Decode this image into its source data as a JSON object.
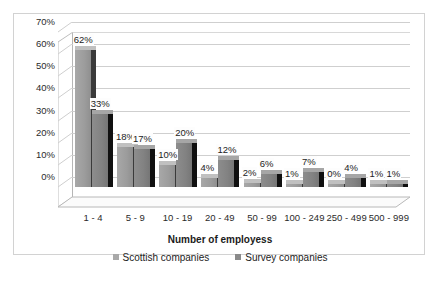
{
  "chart_data": {
    "type": "bar",
    "title": "",
    "subtitle": "",
    "xlabel": "Number of employess",
    "ylabel": "",
    "categories": [
      "1 - 4",
      "5 - 9",
      "10 - 19",
      "20 - 49",
      "50 - 99",
      "100 - 249",
      "250 - 499",
      "500 - 999"
    ],
    "series": [
      {
        "name": "Scottish companies",
        "color": "#a9a9a9",
        "values": [
          62,
          18,
          10,
          4,
          2,
          1,
          0,
          1
        ],
        "labels": [
          "62%",
          "18%",
          "10%",
          "4%",
          "2%",
          "1%",
          "0%",
          "1%"
        ]
      },
      {
        "name": "Survey companies",
        "color": "#8a8a8a",
        "values": [
          33,
          17,
          20,
          12,
          6,
          7,
          4,
          1
        ],
        "labels": [
          "33%",
          "17%",
          "20%",
          "12%",
          "6%",
          "7%",
          "4%",
          "1%"
        ]
      }
    ],
    "ylim": [
      0,
      70
    ],
    "ytick_labels": [
      "70%",
      "60%",
      "50%",
      "40%",
      "30%",
      "20%",
      "10%",
      "0%"
    ],
    "ytick_values": [
      70,
      60,
      50,
      40,
      30,
      20,
      10,
      0
    ],
    "grid": true,
    "legend_position": "bottom",
    "style": "3d-clustered-column",
    "units": "percent"
  },
  "frame": {
    "border_color": "#d2d2d2",
    "background": "#ffffff"
  }
}
